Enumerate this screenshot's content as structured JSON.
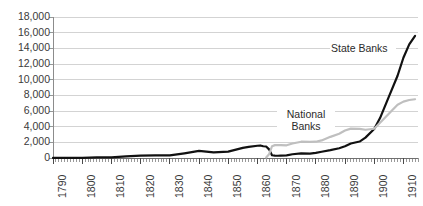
{
  "chart_data": {
    "type": "line",
    "title": "",
    "subtitle": "",
    "xlabel": "",
    "ylabel": "",
    "xlim": [
      1790,
      1915
    ],
    "ylim": [
      0,
      18000
    ],
    "grid": true,
    "grid_axis": "y",
    "legend_position": "inline-annotations",
    "y_ticks": [
      0,
      2000,
      4000,
      6000,
      8000,
      10000,
      12000,
      14000,
      16000,
      18000
    ],
    "y_tick_labels": [
      "0",
      "2,000",
      "4,000",
      "6,000",
      "8,000",
      "10,000",
      "12,000",
      "14,000",
      "16,000",
      "18,000"
    ],
    "x_ticks": [
      1790,
      1800,
      1810,
      1820,
      1830,
      1840,
      1850,
      1860,
      1870,
      1880,
      1890,
      1900,
      1910
    ],
    "x_tick_labels": [
      "1790",
      "1800",
      "1810",
      "1820",
      "1830",
      "1840",
      "1850",
      "1860",
      "1870",
      "1880",
      "1890",
      "1900",
      "1910"
    ],
    "x_minor_tick_step": 1,
    "series": [
      {
        "name": "State Banks",
        "color": "#111111",
        "line_width": 2.2,
        "x": [
          1790,
          1795,
          1800,
          1805,
          1810,
          1815,
          1820,
          1825,
          1830,
          1835,
          1840,
          1845,
          1850,
          1855,
          1857,
          1860,
          1861,
          1862,
          1863,
          1864,
          1865,
          1866,
          1867,
          1868,
          1870,
          1872,
          1875,
          1878,
          1880,
          1882,
          1885,
          1888,
          1890,
          1892,
          1895,
          1897,
          1900,
          1902,
          1905,
          1908,
          1910,
          1912,
          1914
        ],
        "y": [
          4,
          20,
          28,
          75,
          90,
          210,
          300,
          330,
          330,
          600,
          900,
          710,
          820,
          1300,
          1420,
          1560,
          1600,
          1500,
          1470,
          1100,
          350,
          300,
          290,
          310,
          330,
          480,
          600,
          560,
          650,
          800,
          1000,
          1250,
          1500,
          1850,
          2100,
          2600,
          3700,
          5100,
          7800,
          10500,
          12800,
          14500,
          15600
        ]
      },
      {
        "name": "National Banks",
        "color": "#bfbfbf",
        "line_width": 2.2,
        "x": [
          1863,
          1864,
          1865,
          1866,
          1867,
          1868,
          1870,
          1872,
          1875,
          1878,
          1880,
          1882,
          1885,
          1888,
          1890,
          1892,
          1895,
          1897,
          1900,
          1902,
          1905,
          1908,
          1910,
          1912,
          1914
        ],
        "y": [
          66,
          470,
          1500,
          1640,
          1640,
          1640,
          1620,
          1850,
          2080,
          2050,
          2080,
          2240,
          2700,
          3100,
          3500,
          3750,
          3720,
          3610,
          3730,
          4500,
          5650,
          6800,
          7200,
          7400,
          7500
        ]
      }
    ],
    "annotations": [
      {
        "name": "state-banks-label",
        "text": "State Banks",
        "lines": [
          "State Banks"
        ],
        "x_px": 330,
        "y_px": 42,
        "width_px": 64,
        "align": "left"
      },
      {
        "name": "national-banks-label",
        "text": "National Banks",
        "lines": [
          "National",
          "Banks"
        ],
        "x_px": 277,
        "y_px": 108,
        "width_px": 56,
        "align": "center"
      }
    ],
    "colors": {
      "state_banks": "#111111",
      "national_banks": "#bfbfbf",
      "gridline": "#c8c8c8",
      "axis": "#8c8c8c",
      "tick_label": "#3a3a3a",
      "background": "#ffffff"
    },
    "plot_area_px": {
      "left": 53,
      "right": 418,
      "top": 17,
      "bottom": 158
    }
  }
}
